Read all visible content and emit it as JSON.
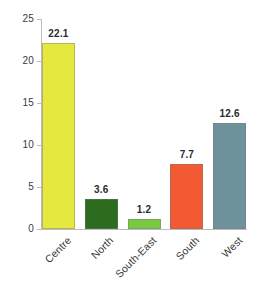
{
  "chart_data": {
    "type": "bar",
    "title": "",
    "subtitle": "",
    "xlabel": "",
    "ylabel": "",
    "categories": [
      "Centre",
      "North",
      "South-East",
      "South",
      "West"
    ],
    "values": [
      22.1,
      3.6,
      1.2,
      7.7,
      12.6
    ],
    "value_labels": [
      "22.1",
      "3.6",
      "1.2",
      "7.7",
      "12.6"
    ],
    "bar_colors": [
      "#e4e83f",
      "#2d6b1f",
      "#7ac943",
      "#f15a33",
      "#6e929c"
    ],
    "ylim": [
      0,
      25
    ],
    "yticks": [
      0,
      5,
      10,
      15,
      20,
      25
    ],
    "ytick_labels": [
      "0",
      "5",
      "10",
      "15",
      "20",
      "25"
    ],
    "grid": false,
    "legend": false,
    "legend_position": "none",
    "annotations": [],
    "axis_color": "#bcbcbc",
    "label_color": "#3c3c3c",
    "value_label_color": "#2b2b2b",
    "background": "#ffffff"
  }
}
